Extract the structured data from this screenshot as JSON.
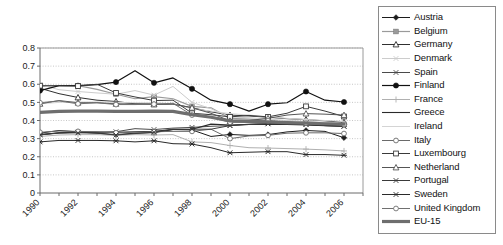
{
  "chart_data": {
    "type": "line",
    "title": "",
    "xlabel": "",
    "ylabel": "",
    "xlim": [
      1990,
      2007
    ],
    "ylim": [
      0,
      0.8
    ],
    "yticks": [
      0,
      0.1,
      0.2,
      0.3,
      0.4,
      0.5,
      0.6,
      0.7,
      0.8
    ],
    "ytick_labels": [
      "0",
      "0.1",
      "0.2",
      "0.3",
      "0.4",
      "0.5",
      "0.6",
      "0.7",
      "0.8"
    ],
    "x": [
      1990,
      1991,
      1992,
      1993,
      1994,
      1995,
      1996,
      1997,
      1998,
      1999,
      2000,
      2001,
      2002,
      2003,
      2004,
      2005,
      2006
    ],
    "xtick_labels": [
      "1990",
      "1992",
      "1994",
      "1996",
      "1998",
      "2000",
      "2002",
      "2004",
      "2006"
    ],
    "xticks": [
      1990,
      1992,
      1994,
      1996,
      1998,
      2000,
      2002,
      2004,
      2006
    ],
    "grid": "horizontal-dotted",
    "legend_position": "right-outside",
    "series": [
      {
        "name": "Austria",
        "marker": "filled-diamond",
        "color": "#1c1c1c",
        "width": 1.0,
        "values": [
          0.33,
          0.345,
          0.337,
          0.33,
          0.322,
          0.33,
          0.333,
          0.35,
          0.348,
          0.312,
          0.323,
          0.318,
          0.322,
          0.337,
          0.345,
          0.34,
          0.305
        ]
      },
      {
        "name": "Belgium",
        "marker": "filled-square",
        "color": "#9a9a9a",
        "width": 1.2,
        "values": [
          0.588,
          0.592,
          0.592,
          0.572,
          0.545,
          0.52,
          0.532,
          0.52,
          0.478,
          0.47,
          0.412,
          0.408,
          0.4,
          0.39,
          0.385,
          0.38,
          0.378
        ]
      },
      {
        "name": "Germany",
        "marker": "open-triangle",
        "color": "#303030",
        "width": 1.0,
        "values": [
          0.578,
          0.548,
          0.527,
          0.512,
          0.505,
          0.492,
          0.492,
          0.492,
          0.47,
          0.448,
          0.43,
          0.425,
          0.418,
          0.41,
          0.405,
          0.398,
          0.39
        ]
      },
      {
        "name": "Denmark",
        "marker": "light-x",
        "color": "#cccccc",
        "width": 1.0,
        "values": [
          0.598,
          0.57,
          0.56,
          0.552,
          0.545,
          0.565,
          0.54,
          0.588,
          0.5,
          0.465,
          0.42,
          0.415,
          0.408,
          0.4,
          0.395,
          0.39,
          0.382
        ]
      },
      {
        "name": "Spain",
        "marker": "x-star",
        "color": "#4a4a4a",
        "width": 1.0,
        "values": [
          0.32,
          0.332,
          0.335,
          0.335,
          0.338,
          0.355,
          0.35,
          0.358,
          0.362,
          0.368,
          0.372,
          0.38,
          0.382,
          0.382,
          0.378,
          0.372,
          0.368
        ]
      },
      {
        "name": "Finland",
        "marker": "filled-circle",
        "color": "#111111",
        "width": 1.2,
        "values": [
          0.565,
          0.592,
          0.592,
          0.598,
          0.612,
          0.675,
          0.608,
          0.635,
          0.575,
          0.512,
          0.49,
          0.452,
          0.49,
          0.498,
          0.56,
          0.512,
          0.502
        ]
      },
      {
        "name": "France",
        "marker": "plus",
        "color": "#b0b0b0",
        "width": 1.0,
        "values": [
          0.312,
          0.32,
          0.322,
          0.322,
          0.318,
          0.322,
          0.32,
          0.322,
          0.282,
          0.278,
          0.262,
          0.25,
          0.248,
          0.245,
          0.242,
          0.238,
          0.232
        ]
      },
      {
        "name": "Greece",
        "marker": "none",
        "color": "#2a2a2a",
        "width": 1.1,
        "values": [
          0.322,
          0.332,
          0.335,
          0.335,
          0.335,
          0.338,
          0.34,
          0.35,
          0.352,
          0.38,
          0.375,
          0.378,
          0.38,
          0.378,
          0.375,
          0.372,
          0.368
        ]
      },
      {
        "name": "Ireland",
        "marker": "none",
        "color": "#d4d4d4",
        "width": 1.0,
        "values": [
          0.492,
          0.5,
          0.502,
          0.502,
          0.5,
          0.498,
          0.498,
          0.492,
          0.465,
          0.452,
          0.438,
          0.43,
          0.42,
          0.412,
          0.405,
          0.4,
          0.395
        ]
      },
      {
        "name": "Italy",
        "marker": "open-circle",
        "color": "#6a6a6a",
        "width": 1.0,
        "values": [
          0.335,
          0.342,
          0.34,
          0.338,
          0.332,
          0.335,
          0.338,
          0.34,
          0.34,
          0.352,
          0.3,
          0.315,
          0.318,
          0.33,
          0.332,
          0.332,
          0.328
        ]
      },
      {
        "name": "Luxembourg",
        "marker": "open-square",
        "color": "#3a3a3a",
        "width": 1.0,
        "values": [
          0.592,
          0.592,
          0.59,
          0.6,
          0.552,
          0.53,
          0.51,
          0.512,
          0.44,
          0.432,
          0.42,
          0.428,
          0.42,
          0.44,
          0.478,
          0.452,
          0.422
        ]
      },
      {
        "name": "Netherland",
        "marker": "open-triangle2",
        "color": "#555555",
        "width": 1.0,
        "values": [
          0.492,
          0.51,
          0.498,
          0.498,
          0.492,
          0.492,
          0.488,
          0.49,
          0.47,
          0.44,
          0.398,
          0.4,
          0.412,
          0.43,
          0.438,
          0.435,
          0.43
        ]
      },
      {
        "name": "Portugal",
        "marker": "x-cross",
        "color": "#3a3a3a",
        "width": 1.0,
        "values": [
          0.322,
          0.33,
          0.332,
          0.33,
          0.32,
          0.328,
          0.335,
          0.352,
          0.352,
          0.352,
          0.372,
          0.378,
          0.382,
          0.38,
          0.378,
          0.372,
          0.368
        ]
      },
      {
        "name": "Sweden",
        "marker": "asterisk",
        "color": "#2a2a2a",
        "width": 1.0,
        "values": [
          0.282,
          0.29,
          0.29,
          0.29,
          0.288,
          0.282,
          0.288,
          0.272,
          0.27,
          0.25,
          0.222,
          0.225,
          0.228,
          0.228,
          0.212,
          0.212,
          0.208
        ]
      },
      {
        "name": "United Kingdom",
        "marker": "open-circle2",
        "color": "#707070",
        "width": 1.0,
        "values": [
          0.498,
          0.508,
          0.492,
          0.498,
          0.488,
          0.488,
          0.49,
          0.495,
          0.43,
          0.42,
          0.39,
          0.39,
          0.398,
          0.392,
          0.385,
          0.382,
          0.378
        ]
      },
      {
        "name": "EU-15",
        "marker": "thick",
        "color": "#6e6e6e",
        "width": 3.2,
        "values": [
          0.445,
          0.45,
          0.452,
          0.452,
          0.45,
          0.45,
          0.452,
          0.45,
          0.432,
          0.418,
          0.398,
          0.395,
          0.392,
          0.388,
          0.385,
          0.382,
          0.38
        ]
      }
    ]
  },
  "legend": {
    "items": [
      {
        "label": "Austria"
      },
      {
        "label": "Belgium"
      },
      {
        "label": "Germany"
      },
      {
        "label": "Denmark"
      },
      {
        "label": "Spain"
      },
      {
        "label": "Finland"
      },
      {
        "label": "France"
      },
      {
        "label": "Greece"
      },
      {
        "label": "Ireland"
      },
      {
        "label": "Italy"
      },
      {
        "label": "Luxembourg"
      },
      {
        "label": "Netherland"
      },
      {
        "label": "Portugal"
      },
      {
        "label": "Sweden"
      },
      {
        "label": "United Kingdom"
      },
      {
        "label": "EU-15"
      }
    ]
  }
}
